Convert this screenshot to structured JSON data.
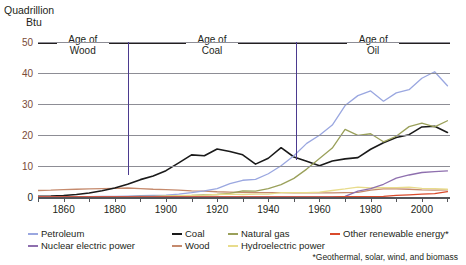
{
  "axis_title": {
    "line1": "Quadrillion",
    "line2": "Btu"
  },
  "footnote": "*Geothermal, solar, wind, and biomass",
  "eras": [
    {
      "label_l1": "Age of",
      "label_l2": "Wood",
      "start": 1850,
      "end": 1885
    },
    {
      "label_l1": "Age of",
      "label_l2": "Coal",
      "start": 1885,
      "end": 1951
    },
    {
      "label_l1": "Age of",
      "label_l2": "Oil",
      "start": 1951,
      "end": 2011
    }
  ],
  "era_dividers": [
    {
      "year": 1885,
      "top_value": 50,
      "bottom_value": 7
    },
    {
      "year": 1951,
      "top_value": 50,
      "bottom_value": 12
    }
  ],
  "legend": [
    {
      "name": "Petroleum",
      "color": "#9aa7e0"
    },
    {
      "name": "Coal",
      "color": "#1a1a1a"
    },
    {
      "name": "Natural gas",
      "color": "#9aa05a"
    },
    {
      "name": "Other renewable energy*",
      "color": "#d94a2b"
    },
    {
      "name": "Nuclear electric power",
      "color": "#8e6fae"
    },
    {
      "name": "Wood",
      "color": "#c58a6d"
    },
    {
      "name": "Hydroelectric power",
      "color": "#e8dc8c"
    }
  ],
  "chart_data": {
    "type": "line",
    "title": "",
    "xlabel": "",
    "ylabel": "Quadrillion Btu",
    "xlim": [
      1850,
      2011
    ],
    "ylim": [
      0,
      50
    ],
    "yticks": [
      0,
      10,
      20,
      30,
      40,
      50
    ],
    "xticks": [
      1860,
      1880,
      1900,
      1920,
      1940,
      1960,
      1980,
      2000
    ],
    "xtick_minor": [
      1850,
      1870,
      1890,
      1910,
      1930,
      1950,
      1970,
      1990,
      2010
    ],
    "grid": true,
    "legend_position": "bottom",
    "x": [
      1850,
      1855,
      1860,
      1865,
      1870,
      1875,
      1880,
      1885,
      1890,
      1895,
      1900,
      1905,
      1910,
      1915,
      1920,
      1925,
      1930,
      1935,
      1940,
      1945,
      1950,
      1955,
      1960,
      1965,
      1970,
      1975,
      1980,
      1985,
      1990,
      1995,
      2000,
      2005,
      2010
    ],
    "series": [
      {
        "name": "Wood",
        "color": "#c58a6d",
        "values": [
          2.1,
          2.2,
          2.4,
          2.5,
          2.6,
          2.7,
          2.8,
          2.9,
          2.7,
          2.5,
          2.4,
          2.2,
          2.0,
          1.9,
          1.7,
          1.6,
          1.5,
          1.4,
          1.4,
          1.4,
          1.3,
          1.3,
          1.3,
          1.3,
          1.4,
          1.5,
          2.2,
          2.6,
          2.6,
          2.5,
          2.3,
          2.2,
          2.3
        ]
      },
      {
        "name": "Coal",
        "color": "#1a1a1a",
        "values": [
          0.2,
          0.3,
          0.5,
          0.8,
          1.3,
          2.0,
          2.9,
          4.1,
          5.6,
          6.8,
          8.5,
          11.0,
          13.6,
          13.3,
          15.5,
          14.7,
          13.6,
          10.6,
          12.5,
          15.9,
          12.9,
          11.5,
          10.1,
          11.6,
          12.3,
          12.7,
          15.4,
          17.5,
          19.2,
          20.1,
          22.6,
          22.8,
          20.8
        ]
      },
      {
        "name": "Petroleum",
        "color": "#9aa7e0",
        "values": [
          0.0,
          0.0,
          0.0,
          0.1,
          0.1,
          0.2,
          0.2,
          0.3,
          0.4,
          0.5,
          0.6,
          0.9,
          1.4,
          2.0,
          2.7,
          4.3,
          5.4,
          5.7,
          7.5,
          10.1,
          13.3,
          17.3,
          19.9,
          23.2,
          29.5,
          32.7,
          34.2,
          30.9,
          33.6,
          34.6,
          38.3,
          40.4,
          35.9
        ]
      },
      {
        "name": "Natural gas",
        "color": "#9aa05a",
        "values": [
          0.0,
          0.0,
          0.0,
          0.0,
          0.0,
          0.0,
          0.0,
          0.1,
          0.2,
          0.2,
          0.3,
          0.4,
          0.5,
          0.7,
          0.8,
          1.2,
          2.0,
          1.9,
          2.7,
          4.0,
          6.0,
          9.0,
          12.4,
          15.8,
          21.8,
          19.9,
          20.4,
          17.8,
          19.6,
          22.7,
          23.8,
          22.6,
          24.6
        ]
      },
      {
        "name": "Hydroelectric power",
        "color": "#e8dc8c",
        "values": [
          0.0,
          0.0,
          0.0,
          0.0,
          0.0,
          0.0,
          0.0,
          0.0,
          0.1,
          0.1,
          0.3,
          0.4,
          0.5,
          0.6,
          0.8,
          0.9,
          0.8,
          0.9,
          0.9,
          1.4,
          1.4,
          1.4,
          1.6,
          2.1,
          2.6,
          3.2,
          2.9,
          3.0,
          3.0,
          3.2,
          2.8,
          2.7,
          2.5
        ]
      },
      {
        "name": "Nuclear electric power",
        "color": "#8e6fae",
        "values": [
          0,
          0,
          0,
          0,
          0,
          0,
          0,
          0,
          0,
          0,
          0,
          0,
          0,
          0,
          0,
          0,
          0,
          0,
          0,
          0,
          0,
          0,
          0.0,
          0.0,
          0.2,
          1.9,
          2.7,
          4.1,
          6.1,
          7.1,
          7.9,
          8.2,
          8.4
        ]
      },
      {
        "name": "Other renewable energy*",
        "color": "#d94a2b",
        "values": [
          0,
          0,
          0,
          0,
          0,
          0,
          0,
          0,
          0,
          0,
          0,
          0,
          0,
          0,
          0,
          0,
          0,
          0,
          0,
          0,
          0,
          0,
          0.0,
          0.0,
          0.1,
          0.1,
          0.1,
          0.2,
          0.5,
          0.7,
          0.9,
          1.1,
          1.7
        ]
      }
    ]
  }
}
